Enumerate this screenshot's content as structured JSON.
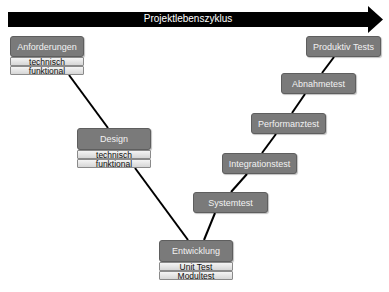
{
  "header": {
    "arrow_label": "Projektlebenszyklus",
    "arrow_color": "#000000"
  },
  "left_phases": {
    "requirements": {
      "title": "Anforderungen",
      "sub": [
        "technisch",
        "funktional"
      ]
    },
    "design": {
      "title": "Design",
      "sub": [
        "technisch",
        "funktional"
      ]
    },
    "development": {
      "title": "Entwicklung",
      "sub": [
        "Unit Test",
        "Modultest"
      ]
    }
  },
  "right_phases": {
    "system_test": "Systemtest",
    "integration_test": "Integrationstest",
    "performance_test": "Performanztest",
    "acceptance_test": "Abnahmetest",
    "production_tests": "Produktiv Tests"
  },
  "colors": {
    "box_fill": "#7a7a7a",
    "box_text": "#f2f2f2",
    "sub_fill": "#e6e6e6",
    "line": "#000000"
  }
}
